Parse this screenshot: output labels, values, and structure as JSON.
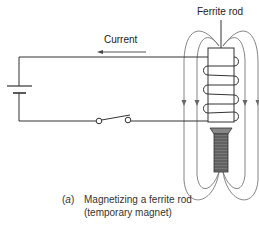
{
  "diagram": {
    "labels": {
      "current": "Current",
      "ferrite_rod": "Ferrite rod"
    },
    "caption": {
      "marker_open": "(",
      "marker_letter": "a",
      "marker_close": ")",
      "line1": "Magnetizing a ferrite rod",
      "line2": "(temporary magnet)"
    },
    "components": [
      "battery",
      "switch",
      "coil",
      "ferrite-rod",
      "screw",
      "magnetic-field-lines",
      "current-arrow"
    ],
    "colors": {
      "wire": "#333333",
      "field_lines": "#666666",
      "screw": "#555555"
    }
  }
}
